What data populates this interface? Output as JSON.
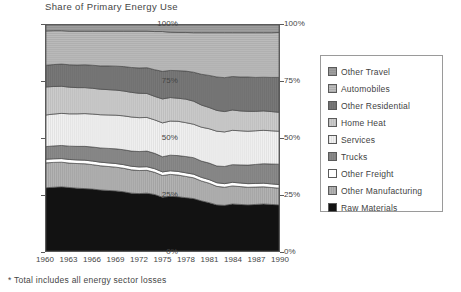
{
  "chart_data": {
    "type": "area",
    "title": "Share of Primary Energy Use",
    "xlabel": "",
    "ylabel": "",
    "ylim": [
      0,
      100
    ],
    "ytick_labels": [
      "100%",
      "75%",
      "50%",
      "25%",
      "0%"
    ],
    "ytick_values": [
      100,
      75,
      50,
      25,
      0
    ],
    "right_axis_labels": [
      "100%",
      "75%",
      "50%",
      "25%",
      "0%"
    ],
    "grid": false,
    "legend_position": "right",
    "stacked": true,
    "stack_order": "bottom-to-top",
    "footnote": "* Total includes all energy sector losses",
    "x": [
      1960,
      1961,
      1962,
      1963,
      1964,
      1965,
      1966,
      1967,
      1968,
      1969,
      1970,
      1971,
      1972,
      1973,
      1974,
      1975,
      1976,
      1977,
      1978,
      1979,
      1980,
      1981,
      1982,
      1983,
      1984,
      1985,
      1986,
      1987,
      1988,
      1989,
      1990
    ],
    "xtick_labels": [
      "1960",
      "1963",
      "1966",
      "1969",
      "1972",
      "1975",
      "1978",
      "1981",
      "1984",
      "1987",
      "1990"
    ],
    "xtick_values": [
      1960,
      1963,
      1966,
      1969,
      1972,
      1975,
      1978,
      1981,
      1984,
      1987,
      1990
    ],
    "series": [
      {
        "name": "Raw Materials",
        "color": "#121212",
        "pattern": "solid-black",
        "values": [
          28.0,
          28.2,
          28.4,
          28.1,
          27.8,
          27.6,
          27.4,
          27.0,
          26.8,
          26.6,
          26.2,
          25.6,
          25.4,
          25.6,
          25.0,
          23.8,
          24.2,
          24.0,
          23.6,
          23.2,
          22.2,
          21.4,
          20.4,
          20.2,
          20.8,
          20.6,
          20.4,
          20.6,
          20.8,
          20.6,
          20.4
        ]
      },
      {
        "name": "Other Manufacturing",
        "color": "#b4b4b4",
        "pattern": "light-gray",
        "values": [
          11.0,
          11.0,
          10.9,
          10.8,
          10.9,
          11.0,
          10.8,
          10.7,
          10.6,
          10.5,
          10.4,
          10.3,
          10.2,
          10.1,
          9.8,
          9.6,
          9.7,
          9.6,
          9.4,
          9.2,
          8.8,
          8.6,
          8.2,
          8.0,
          8.0,
          7.9,
          7.8,
          7.7,
          7.6,
          7.5,
          7.4
        ]
      },
      {
        "name": "Other Freight",
        "color": "#ffffff",
        "pattern": "white",
        "values": [
          1.6,
          1.6,
          1.6,
          1.6,
          1.6,
          1.6,
          1.6,
          1.6,
          1.6,
          1.6,
          1.6,
          1.6,
          1.6,
          1.6,
          1.6,
          1.6,
          1.6,
          1.6,
          1.6,
          1.6,
          1.6,
          1.6,
          1.6,
          1.6,
          1.6,
          1.6,
          1.6,
          1.6,
          1.6,
          1.6,
          1.6
        ]
      },
      {
        "name": "Trucks",
        "color": "#8a8a8a",
        "pattern": "medium-gray",
        "values": [
          5.6,
          5.7,
          5.8,
          5.9,
          6.0,
          6.1,
          6.2,
          6.3,
          6.4,
          6.5,
          6.6,
          6.7,
          6.8,
          6.9,
          6.8,
          6.7,
          6.9,
          7.0,
          7.2,
          7.3,
          7.2,
          7.3,
          7.4,
          7.6,
          7.8,
          8.0,
          8.2,
          8.4,
          8.6,
          8.8,
          9.0
        ]
      },
      {
        "name": "Services",
        "color": "#f2f2f2",
        "pattern": "near-white-vertical",
        "values": [
          14.0,
          14.1,
          14.2,
          14.3,
          14.4,
          14.5,
          14.6,
          14.7,
          14.8,
          14.9,
          15.0,
          15.1,
          15.0,
          14.9,
          14.8,
          15.0,
          15.1,
          15.2,
          15.0,
          14.8,
          15.0,
          15.2,
          15.4,
          15.3,
          15.2,
          15.1,
          15.0,
          14.9,
          14.8,
          14.7,
          14.6
        ]
      },
      {
        "name": "Home Heat",
        "color": "#cccccc",
        "pattern": "light-gray-vertical",
        "values": [
          12.4,
          12.2,
          12.0,
          11.8,
          11.6,
          11.5,
          11.4,
          11.3,
          11.2,
          11.1,
          11.0,
          10.9,
          10.8,
          10.6,
          10.4,
          10.6,
          10.4,
          10.2,
          10.4,
          10.2,
          9.8,
          9.4,
          9.2,
          9.0,
          9.0,
          8.8,
          8.8,
          8.6,
          8.6,
          8.5,
          8.4
        ]
      },
      {
        "name": "Other Residential",
        "color": "#787878",
        "pattern": "dark-gray",
        "values": [
          9.6,
          9.7,
          9.8,
          9.9,
          10.0,
          10.1,
          10.2,
          10.3,
          10.5,
          10.6,
          10.8,
          11.0,
          11.2,
          11.4,
          11.8,
          12.2,
          12.0,
          12.2,
          12.4,
          12.8,
          13.6,
          14.2,
          14.8,
          15.0,
          14.8,
          15.0,
          15.2,
          15.0,
          14.9,
          15.1,
          15.4
        ]
      },
      {
        "name": "Automobiles",
        "color": "#bdbdbd",
        "pattern": "hatched-light",
        "values": [
          15.2,
          15.0,
          14.8,
          14.9,
          15.0,
          14.9,
          15.1,
          15.4,
          15.4,
          15.5,
          15.7,
          16.1,
          16.3,
          16.2,
          16.9,
          17.6,
          16.9,
          16.9,
          17.1,
          17.5,
          18.4,
          18.9,
          19.6,
          19.9,
          19.4,
          19.6,
          19.6,
          19.8,
          19.7,
          19.8,
          19.9
        ]
      },
      {
        "name": "Other Travel",
        "color": "#9e9e9e",
        "pattern": "gray",
        "values": [
          2.6,
          2.5,
          2.5,
          2.7,
          2.7,
          2.7,
          2.7,
          2.7,
          2.7,
          2.7,
          2.7,
          2.7,
          2.7,
          2.7,
          2.9,
          2.9,
          3.2,
          3.3,
          3.3,
          3.4,
          3.4,
          3.4,
          3.4,
          3.4,
          3.4,
          3.4,
          3.4,
          3.4,
          3.4,
          3.4,
          3.3
        ]
      }
    ]
  },
  "legend": {
    "items": [
      {
        "label": "Other Travel",
        "color": "#9e9e9e"
      },
      {
        "label": "Automobiles",
        "color": "#bdbdbd"
      },
      {
        "label": "Other Residential",
        "color": "#787878"
      },
      {
        "label": "Home Heat",
        "color": "#cccccc"
      },
      {
        "label": "Services",
        "color": "#f2f2f2"
      },
      {
        "label": "Trucks",
        "color": "#8a8a8a"
      },
      {
        "label": "Other Freight",
        "color": "#ffffff"
      },
      {
        "label": "Other Manufacturing",
        "color": "#b4b4b4"
      },
      {
        "label": "Raw Materials",
        "color": "#121212"
      }
    ]
  }
}
